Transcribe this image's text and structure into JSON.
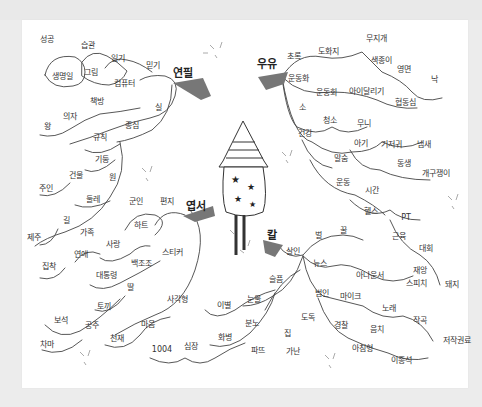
{
  "center": {
    "name": "firecracker-rocket",
    "stars": 4
  },
  "hubs": [
    {
      "label": "연필",
      "x": 183,
      "y": 73
    },
    {
      "label": "우유",
      "x": 267,
      "y": 64
    },
    {
      "label": "엽서",
      "x": 196,
      "y": 206
    },
    {
      "label": "칼",
      "x": 272,
      "y": 235
    }
  ],
  "words": [
    {
      "t": "성공",
      "x": 47,
      "y": 40
    },
    {
      "t": "습관",
      "x": 88,
      "y": 46
    },
    {
      "t": "일기",
      "x": 118,
      "y": 59
    },
    {
      "t": "믿기",
      "x": 153,
      "y": 66
    },
    {
      "t": "생명일",
      "x": 62,
      "y": 77
    },
    {
      "t": "그림",
      "x": 91,
      "y": 73
    },
    {
      "t": "컴퓨터",
      "x": 124,
      "y": 84
    },
    {
      "t": "책방",
      "x": 97,
      "y": 102
    },
    {
      "t": "실",
      "x": 158,
      "y": 108
    },
    {
      "t": "의자",
      "x": 70,
      "y": 117
    },
    {
      "t": "왕",
      "x": 47,
      "y": 127
    },
    {
      "t": "규칙",
      "x": 100,
      "y": 138
    },
    {
      "t": "종심",
      "x": 132,
      "y": 126
    },
    {
      "t": "기둥",
      "x": 102,
      "y": 160
    },
    {
      "t": "건물",
      "x": 76,
      "y": 176
    },
    {
      "t": "원",
      "x": 112,
      "y": 178
    },
    {
      "t": "주인",
      "x": 46,
      "y": 189
    },
    {
      "t": "둘레",
      "x": 93,
      "y": 200
    },
    {
      "t": "군인",
      "x": 136,
      "y": 202
    },
    {
      "t": "편지",
      "x": 167,
      "y": 202
    },
    {
      "t": "길",
      "x": 66,
      "y": 221
    },
    {
      "t": "하트",
      "x": 141,
      "y": 226
    },
    {
      "t": "제주",
      "x": 34,
      "y": 238
    },
    {
      "t": "가족",
      "x": 87,
      "y": 233
    },
    {
      "t": "사랑",
      "x": 113,
      "y": 245
    },
    {
      "t": "연애",
      "x": 81,
      "y": 255
    },
    {
      "t": "스티커",
      "x": 172,
      "y": 253
    },
    {
      "t": "집착",
      "x": 49,
      "y": 267
    },
    {
      "t": "백조조",
      "x": 141,
      "y": 264
    },
    {
      "t": "대통령",
      "x": 106,
      "y": 276
    },
    {
      "t": "딸",
      "x": 130,
      "y": 288
    },
    {
      "t": "토끼",
      "x": 104,
      "y": 307
    },
    {
      "t": "사각형",
      "x": 177,
      "y": 300
    },
    {
      "t": "보석",
      "x": 61,
      "y": 321
    },
    {
      "t": "공주",
      "x": 92,
      "y": 326
    },
    {
      "t": "이별",
      "x": 224,
      "y": 306
    },
    {
      "t": "눈물",
      "x": 254,
      "y": 300
    },
    {
      "t": "마음",
      "x": 148,
      "y": 325
    },
    {
      "t": "천재",
      "x": 117,
      "y": 339
    },
    {
      "t": "분노",
      "x": 252,
      "y": 324
    },
    {
      "t": "화병",
      "x": 225,
      "y": 338
    },
    {
      "t": "차마",
      "x": 47,
      "y": 345
    },
    {
      "t": "1004",
      "x": 162,
      "y": 350
    },
    {
      "t": "심장",
      "x": 191,
      "y": 347
    },
    {
      "t": "파뜨",
      "x": 258,
      "y": 351
    },
    {
      "t": "가난",
      "x": 293,
      "y": 352
    },
    {
      "t": "집",
      "x": 287,
      "y": 334
    },
    {
      "t": "도독",
      "x": 308,
      "y": 318
    },
    {
      "t": "무지개",
      "x": 376,
      "y": 39
    },
    {
      "t": "도화지",
      "x": 328,
      "y": 52
    },
    {
      "t": "초록",
      "x": 294,
      "y": 57
    },
    {
      "t": "색종이",
      "x": 381,
      "y": 61
    },
    {
      "t": "영면",
      "x": 404,
      "y": 70
    },
    {
      "t": "낙",
      "x": 434,
      "y": 80
    },
    {
      "t": "운동화",
      "x": 298,
      "y": 79
    },
    {
      "t": "운동회",
      "x": 326,
      "y": 93
    },
    {
      "t": "아이달리기",
      "x": 366,
      "y": 92
    },
    {
      "t": "협동심",
      "x": 405,
      "y": 103
    },
    {
      "t": "소",
      "x": 302,
      "y": 108
    },
    {
      "t": "청소",
      "x": 330,
      "y": 121
    },
    {
      "t": "무니",
      "x": 364,
      "y": 124
    },
    {
      "t": "건강",
      "x": 305,
      "y": 134
    },
    {
      "t": "아기",
      "x": 361,
      "y": 144
    },
    {
      "t": "기저귀",
      "x": 391,
      "y": 145
    },
    {
      "t": "냄새",
      "x": 424,
      "y": 145
    },
    {
      "t": "말숨",
      "x": 341,
      "y": 159
    },
    {
      "t": "동생",
      "x": 404,
      "y": 164
    },
    {
      "t": "개구쟁이",
      "x": 436,
      "y": 174
    },
    {
      "t": "운동",
      "x": 343,
      "y": 183
    },
    {
      "t": "시간",
      "x": 372,
      "y": 191
    },
    {
      "t": "헬스",
      "x": 371,
      "y": 212
    },
    {
      "t": "PT",
      "x": 406,
      "y": 218
    },
    {
      "t": "근육",
      "x": 399,
      "y": 237
    },
    {
      "t": "대회",
      "x": 426,
      "y": 249
    },
    {
      "t": "벌",
      "x": 318,
      "y": 236
    },
    {
      "t": "꿀",
      "x": 343,
      "y": 231
    },
    {
      "t": "살인",
      "x": 293,
      "y": 252
    },
    {
      "t": "뉴스",
      "x": 320,
      "y": 264
    },
    {
      "t": "아나운서",
      "x": 370,
      "y": 276
    },
    {
      "t": "재앙",
      "x": 420,
      "y": 271
    },
    {
      "t": "스피치",
      "x": 416,
      "y": 284
    },
    {
      "t": "돼지",
      "x": 452,
      "y": 285
    },
    {
      "t": "슬픔",
      "x": 276,
      "y": 280
    },
    {
      "t": "범인",
      "x": 322,
      "y": 294
    },
    {
      "t": "마이크",
      "x": 350,
      "y": 297
    },
    {
      "t": "노래",
      "x": 389,
      "y": 309
    },
    {
      "t": "작곡",
      "x": 420,
      "y": 321
    },
    {
      "t": "경찰",
      "x": 341,
      "y": 326
    },
    {
      "t": "음치",
      "x": 377,
      "y": 330
    },
    {
      "t": "저작권료",
      "x": 457,
      "y": 341
    },
    {
      "t": "아침형",
      "x": 362,
      "y": 349
    },
    {
      "t": "이종석",
      "x": 401,
      "y": 361
    }
  ],
  "colors": {
    "ink": "#333333",
    "paper": "#ffffff",
    "frame": "#ececec"
  }
}
